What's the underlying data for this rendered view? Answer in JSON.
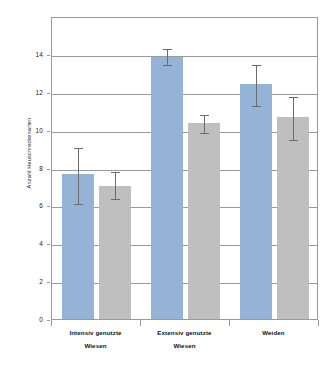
{
  "top_ghost_text": "",
  "chart_data": {
    "type": "bar",
    "title": "",
    "subtitle": "",
    "xlabel": "",
    "ylabel": "Anzahl Heuschreckenarten",
    "ylim": [
      0,
      16
    ],
    "yticks": [
      0,
      2,
      4,
      6,
      8,
      10,
      12,
      14
    ],
    "ytick_labels": [
      "0",
      "2",
      "4",
      "6",
      "8",
      "10",
      "12",
      "14"
    ],
    "grid": true,
    "grid_axis": "y",
    "legend": null,
    "legend_position": "none",
    "categories": [
      "Intensiv genutzte Wiesen",
      "Extensiv genutzte Wiesen",
      "Weiden"
    ],
    "category_lines": [
      [
        "Intensiv genutzte",
        "Wiesen"
      ],
      [
        "Extensiv genutzte",
        "Wiesen"
      ],
      [
        "Weiden",
        ""
      ]
    ],
    "series": [
      {
        "name": "Serie 1",
        "color": "#95b3d7",
        "values": [
          7.65,
          13.85,
          12.4
        ],
        "err_low": [
          6.15,
          13.45,
          11.3
        ],
        "err_high": [
          9.15,
          14.35,
          13.5
        ]
      },
      {
        "name": "Serie 2",
        "color": "#bfbfbf",
        "values": [
          7.05,
          10.35,
          10.65
        ],
        "err_low": [
          6.4,
          9.85,
          9.5
        ],
        "err_high": [
          7.85,
          10.9,
          11.85
        ]
      }
    ],
    "errorbar_color": "#6b6b6b",
    "frame_color": "#9a9a9a"
  }
}
